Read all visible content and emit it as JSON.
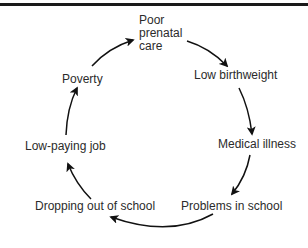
{
  "diagram": {
    "type": "cycle",
    "rule_color": "#1a1a1a",
    "arrow_color": "#111111",
    "text_color": "#2b2b2b",
    "nodes": [
      {
        "id": "poor-prenatal-care",
        "label": "Poor\nprenatal\ncare"
      },
      {
        "id": "low-birthweight",
        "label": "Low birthweight"
      },
      {
        "id": "medical-illness",
        "label": "Medical illness"
      },
      {
        "id": "problems-in-school",
        "label": "Problems in school"
      },
      {
        "id": "dropping-out-of-school",
        "label": "Dropping out of school"
      },
      {
        "id": "low-paying-job",
        "label": "Low-paying job"
      },
      {
        "id": "poverty",
        "label": "Poverty"
      }
    ],
    "edges": [
      {
        "from": "poor-prenatal-care",
        "to": "low-birthweight"
      },
      {
        "from": "low-birthweight",
        "to": "medical-illness"
      },
      {
        "from": "medical-illness",
        "to": "problems-in-school"
      },
      {
        "from": "problems-in-school",
        "to": "dropping-out-of-school"
      },
      {
        "from": "dropping-out-of-school",
        "to": "low-paying-job"
      },
      {
        "from": "low-paying-job",
        "to": "poverty"
      },
      {
        "from": "poverty",
        "to": "poor-prenatal-care"
      }
    ]
  }
}
